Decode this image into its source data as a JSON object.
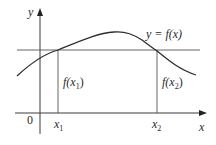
{
  "diagram": {
    "axes": {
      "x_label": "x",
      "y_label": "y",
      "origin_label": "0"
    },
    "curve": {
      "label": "y = f(x)"
    },
    "points": [
      {
        "x_label": "x",
        "x_sub": "1",
        "value_label": "f(x",
        "value_sub": "1",
        "value_close": ")"
      },
      {
        "x_label": "x",
        "x_sub": "2",
        "value_label": "f(x",
        "value_sub": "2",
        "value_close": ")"
      }
    ],
    "horizontal_line": "equal values f(x1) = f(x2)",
    "colors": {
      "stroke": "#3a3a3a",
      "text": "#2a2a2a",
      "background": "#ffffff"
    }
  }
}
